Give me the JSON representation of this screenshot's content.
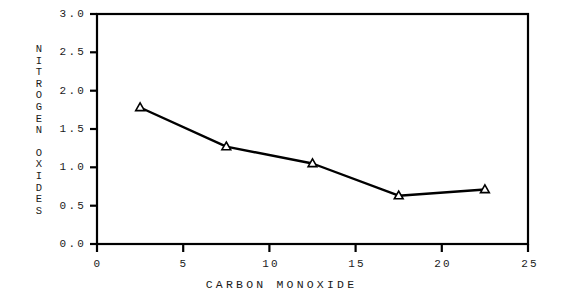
{
  "chart_data": {
    "type": "line",
    "title": "",
    "xlabel": "CARBON MONOXIDE",
    "ylabel": "NITROGEN OXIDES",
    "x": [
      2.5,
      7.5,
      12.5,
      17.5,
      22.5
    ],
    "values": [
      1.78,
      1.27,
      1.05,
      0.63,
      0.71
    ],
    "series": [
      {
        "name": "NITROGEN OXIDES",
        "x": [
          2.5,
          7.5,
          12.5,
          17.5,
          22.5
        ],
        "values": [
          1.78,
          1.27,
          1.05,
          0.63,
          0.71
        ]
      }
    ],
    "xlim": [
      0,
      25
    ],
    "ylim": [
      0,
      3.0
    ],
    "xticks": [
      0,
      5,
      10,
      15,
      20,
      25
    ],
    "xtick_labels": [
      "0",
      "5",
      "10",
      "15",
      "20",
      "25"
    ],
    "yticks": [
      0.0,
      0.5,
      1.0,
      1.5,
      2.0,
      2.5,
      3.0
    ],
    "ytick_labels": [
      "0.0",
      "0.5",
      "1.0",
      "1.5",
      "2.0",
      "2.5",
      "3.0"
    ],
    "grid": false,
    "legend": null,
    "marker": "triangle-up",
    "line_color": "#000000",
    "marker_color": "#000000",
    "background_color": "#ffffff"
  },
  "axis_titles": {
    "x": "CARBON MONOXIDE",
    "y_line1": "NITROGEN",
    "y_line2": "OXIDES"
  }
}
